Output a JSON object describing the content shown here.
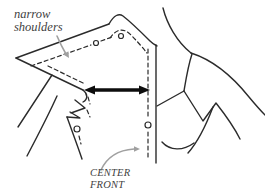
{
  "canvas": {
    "width": 265,
    "height": 196,
    "background": "#ffffff"
  },
  "colors": {
    "line_art": "#2b2b2b",
    "label_text": "#3f3f3f",
    "callout_arrow": "#a0a0a0",
    "emphasis_arrow": "#0d0d0d"
  },
  "labels": {
    "narrow_shoulders": {
      "line1": "narrow",
      "line2": "shoulders"
    },
    "center_front": {
      "line1": "CENTER",
      "line2": "FRONT"
    }
  },
  "callouts": [
    {
      "label": "narrow shoulders",
      "target": "dashed-shoulder-seamline"
    },
    {
      "label": "CENTER FRONT",
      "target": "dashed-center-front-line"
    }
  ],
  "diagram_parts": [
    "body-outline",
    "pattern-piece-solid-outline",
    "pattern-dashed-alteration-lines",
    "notch-circles",
    "shoulder-width-double-arrow"
  ]
}
